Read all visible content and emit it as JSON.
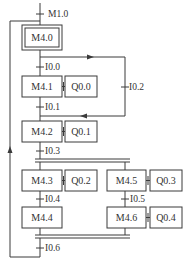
{
  "diagram": {
    "type": "sequential-function-chart",
    "colors": {
      "line": "#3a3a3a",
      "text": "#333333",
      "background": "#ffffff"
    },
    "initial_step": {
      "id": "M4.0"
    },
    "steps": [
      {
        "id": "M4.0",
        "action": null
      },
      {
        "id": "M4.1",
        "action": "Q0.0"
      },
      {
        "id": "M4.2",
        "action": "Q0.1"
      },
      {
        "id": "M4.3",
        "action": "Q0.2"
      },
      {
        "id": "M4.4",
        "action": null
      },
      {
        "id": "M4.5",
        "action": "Q0.3"
      },
      {
        "id": "M4.6",
        "action": "Q0.4"
      }
    ],
    "transitions": [
      {
        "id": "M1.0"
      },
      {
        "id": "I0.0"
      },
      {
        "id": "I0.1"
      },
      {
        "id": "I0.2"
      },
      {
        "id": "I0.3"
      },
      {
        "id": "I0.4"
      },
      {
        "id": "I0.5"
      },
      {
        "id": "I0.6"
      }
    ]
  }
}
